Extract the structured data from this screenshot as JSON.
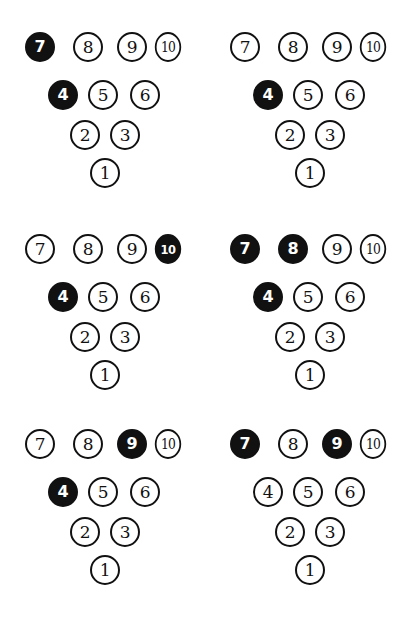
{
  "figure": {
    "type": "bowling-pin-deck-diagram",
    "background_color": "#ffffff",
    "pin_outline_color": "#111111",
    "pin_filled_color": "#111111",
    "pin_filled_text_color": "#ffffff",
    "pin_open_text_color": "#111111",
    "rows": [
      {
        "labels": [
          "7",
          "8",
          "9",
          "10"
        ]
      },
      {
        "labels": [
          "4",
          "5",
          "6"
        ]
      },
      {
        "labels": [
          "2",
          "3"
        ]
      },
      {
        "labels": [
          "1"
        ]
      }
    ],
    "panel_grid": {
      "columns": 2,
      "rows": 3,
      "total_panels": 6
    },
    "panels": [
      {
        "position": "top-left",
        "index": 1,
        "filled_pins": [
          "7",
          "4"
        ],
        "pins": [
          {
            "label": "7",
            "filled": true
          },
          {
            "label": "8",
            "filled": false
          },
          {
            "label": "9",
            "filled": false
          },
          {
            "label": "10",
            "filled": false
          },
          {
            "label": "4",
            "filled": true
          },
          {
            "label": "5",
            "filled": false
          },
          {
            "label": "6",
            "filled": false
          },
          {
            "label": "2",
            "filled": false
          },
          {
            "label": "3",
            "filled": false
          },
          {
            "label": "1",
            "filled": false
          }
        ]
      },
      {
        "position": "top-right",
        "index": 2,
        "filled_pins": [
          "4"
        ],
        "pins": [
          {
            "label": "7",
            "filled": false
          },
          {
            "label": "8",
            "filled": false
          },
          {
            "label": "9",
            "filled": false
          },
          {
            "label": "10",
            "filled": false
          },
          {
            "label": "4",
            "filled": true
          },
          {
            "label": "5",
            "filled": false
          },
          {
            "label": "6",
            "filled": false
          },
          {
            "label": "2",
            "filled": false
          },
          {
            "label": "3",
            "filled": false
          },
          {
            "label": "1",
            "filled": false
          }
        ]
      },
      {
        "position": "middle-left",
        "index": 3,
        "filled_pins": [
          "10",
          "4"
        ],
        "pins": [
          {
            "label": "7",
            "filled": false
          },
          {
            "label": "8",
            "filled": false
          },
          {
            "label": "9",
            "filled": false
          },
          {
            "label": "10",
            "filled": true
          },
          {
            "label": "4",
            "filled": true
          },
          {
            "label": "5",
            "filled": false
          },
          {
            "label": "6",
            "filled": false
          },
          {
            "label": "2",
            "filled": false
          },
          {
            "label": "3",
            "filled": false
          },
          {
            "label": "1",
            "filled": false
          }
        ]
      },
      {
        "position": "middle-right",
        "index": 4,
        "filled_pins": [
          "7",
          "8",
          "4"
        ],
        "pins": [
          {
            "label": "7",
            "filled": true
          },
          {
            "label": "8",
            "filled": true
          },
          {
            "label": "9",
            "filled": false
          },
          {
            "label": "10",
            "filled": false
          },
          {
            "label": "4",
            "filled": true
          },
          {
            "label": "5",
            "filled": false
          },
          {
            "label": "6",
            "filled": false
          },
          {
            "label": "2",
            "filled": false
          },
          {
            "label": "3",
            "filled": false
          },
          {
            "label": "1",
            "filled": false
          }
        ]
      },
      {
        "position": "bottom-left",
        "index": 5,
        "filled_pins": [
          "9",
          "4"
        ],
        "pins": [
          {
            "label": "7",
            "filled": false
          },
          {
            "label": "8",
            "filled": false
          },
          {
            "label": "9",
            "filled": true
          },
          {
            "label": "10",
            "filled": false
          },
          {
            "label": "4",
            "filled": true
          },
          {
            "label": "5",
            "filled": false
          },
          {
            "label": "6",
            "filled": false
          },
          {
            "label": "2",
            "filled": false
          },
          {
            "label": "3",
            "filled": false
          },
          {
            "label": "1",
            "filled": false
          }
        ]
      },
      {
        "position": "bottom-right",
        "index": 6,
        "filled_pins": [
          "7",
          "9"
        ],
        "pins": [
          {
            "label": "7",
            "filled": true
          },
          {
            "label": "8",
            "filled": false
          },
          {
            "label": "9",
            "filled": true
          },
          {
            "label": "10",
            "filled": false
          },
          {
            "label": "4",
            "filled": false
          },
          {
            "label": "5",
            "filled": false
          },
          {
            "label": "6",
            "filled": false
          },
          {
            "label": "2",
            "filled": false
          },
          {
            "label": "3",
            "filled": false
          },
          {
            "label": "1",
            "filled": false
          }
        ]
      }
    ]
  }
}
